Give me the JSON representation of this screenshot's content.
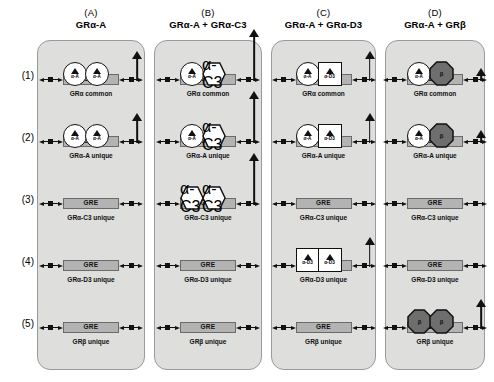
{
  "figure": {
    "type": "diagram",
    "row_labels": [
      "(1)",
      "(2)",
      "(3)",
      "(4)",
      "(5)"
    ],
    "gre_label": "GRE",
    "columns": [
      {
        "letter": "(A)",
        "title": "GRα-A"
      },
      {
        "letter": "(B)",
        "title": "GRα-A + GRα-C3"
      },
      {
        "letter": "(C)",
        "title": "GRα-A + GRα-D3"
      },
      {
        "letter": "(D)",
        "title": "GRα-A + GRβ"
      }
    ],
    "row_captions": [
      "GRα common",
      "GRα-A unique",
      "GRα-C3 unique",
      "GRα-D3 unique",
      "GRβ unique"
    ],
    "monomer_types": {
      "alpha-A": {
        "label": "α-A",
        "shape": "circle",
        "fill": "#ffffff",
        "has_ligand": true
      },
      "alpha-C3": {
        "label": "α-C3",
        "shape": "hexagon",
        "fill": "#ffffff",
        "has_ligand": true
      },
      "alpha-D3": {
        "label": "α-D3",
        "shape": "square",
        "fill": "#ffffff",
        "has_ligand": true
      },
      "beta": {
        "label": "β",
        "shape": "octagon",
        "fill": "#6e6e6e",
        "has_ligand": false
      }
    },
    "colors": {
      "panel_background": "#dededd",
      "panel_border": "#9a9a9a",
      "gre_fill": "#b3b3b3",
      "gre_border": "#6a6a6a",
      "beta_fill": "#6e6e6e",
      "ink": "#111111",
      "page_background": "#ffffff"
    },
    "cells": [
      {
        "col": 0,
        "row": 0,
        "caption": "GRα common",
        "monomers": [
          "alpha-A",
          "alpha-A"
        ],
        "arrow": "medium"
      },
      {
        "col": 0,
        "row": 1,
        "caption": "GRα-A unique",
        "monomers": [
          "alpha-A",
          "alpha-A"
        ],
        "arrow": "medium"
      },
      {
        "col": 0,
        "row": 2,
        "caption": "GRα-C3 unique",
        "monomers": [],
        "arrow": "none"
      },
      {
        "col": 0,
        "row": 3,
        "caption": "GRα-D3 unique",
        "monomers": [],
        "arrow": "none"
      },
      {
        "col": 0,
        "row": 4,
        "caption": "GRβ unique",
        "monomers": [],
        "arrow": "none"
      },
      {
        "col": 1,
        "row": 0,
        "caption": "GRα common",
        "monomers": [
          "alpha-A",
          "alpha-C3"
        ],
        "arrow": "tall"
      },
      {
        "col": 1,
        "row": 1,
        "caption": "GRα-A unique",
        "monomers": [
          "alpha-A",
          "alpha-C3"
        ],
        "arrow": "tall"
      },
      {
        "col": 1,
        "row": 2,
        "caption": "GRα-C3 unique",
        "monomers": [
          "alpha-C3",
          "alpha-C3"
        ],
        "arrow": "tall"
      },
      {
        "col": 1,
        "row": 3,
        "caption": "GRα-D3 unique",
        "monomers": [],
        "arrow": "none"
      },
      {
        "col": 1,
        "row": 4,
        "caption": "GRβ unique",
        "monomers": [],
        "arrow": "none"
      },
      {
        "col": 2,
        "row": 0,
        "caption": "GRα common",
        "monomers": [
          "alpha-A",
          "alpha-D3"
        ],
        "arrow": "medium"
      },
      {
        "col": 2,
        "row": 1,
        "caption": "GRα-A unique",
        "monomers": [
          "alpha-A",
          "alpha-D3"
        ],
        "arrow": "medium"
      },
      {
        "col": 2,
        "row": 2,
        "caption": "GRα-C3 unique",
        "monomers": [],
        "arrow": "none"
      },
      {
        "col": 2,
        "row": 3,
        "caption": "GRα-D3 unique",
        "monomers": [
          "alpha-D3",
          "alpha-D3"
        ],
        "arrow": "medium"
      },
      {
        "col": 2,
        "row": 4,
        "caption": "GRβ unique",
        "monomers": [],
        "arrow": "none"
      },
      {
        "col": 3,
        "row": 0,
        "caption": "GRα common",
        "monomers": [
          "alpha-A",
          "beta"
        ],
        "arrow": "short"
      },
      {
        "col": 3,
        "row": 1,
        "caption": "GRα-A unique",
        "monomers": [
          "alpha-A",
          "beta"
        ],
        "arrow": "short"
      },
      {
        "col": 3,
        "row": 2,
        "caption": "GRα-C3 unique",
        "monomers": [],
        "arrow": "none"
      },
      {
        "col": 3,
        "row": 3,
        "caption": "GRα-D3 unique",
        "monomers": [],
        "arrow": "none"
      },
      {
        "col": 3,
        "row": 4,
        "caption": "GRβ unique",
        "monomers": [
          "beta",
          "beta"
        ],
        "arrow": "medium"
      }
    ]
  }
}
